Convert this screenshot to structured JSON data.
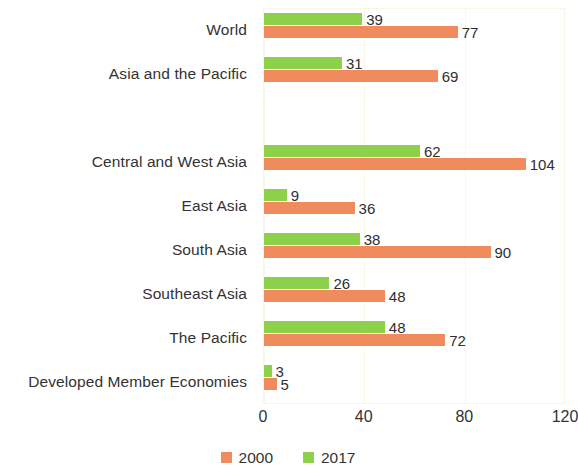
{
  "chart_data": {
    "type": "bar",
    "orientation": "horizontal",
    "title": "",
    "xlabel": "",
    "ylabel": "",
    "xlim": [
      0,
      120
    ],
    "xticks": [
      "0",
      "40",
      "80",
      "120"
    ],
    "grid": true,
    "legend_position": "bottom",
    "categories": [
      "World",
      "Asia and the Pacific",
      "",
      "Central and West Asia",
      "East Asia",
      "South Asia",
      "Southeast Asia",
      "The Pacific",
      "Developed Member Economies"
    ],
    "series": [
      {
        "name": "2000",
        "color": "#ef8b5d",
        "values": [
          77,
          69,
          null,
          104,
          36,
          90,
          48,
          72,
          5
        ]
      },
      {
        "name": "2017",
        "color": "#8dd14a",
        "values": [
          39,
          31,
          null,
          62,
          9,
          38,
          26,
          48,
          3
        ]
      }
    ]
  },
  "legend": {
    "items": [
      {
        "label": "2000",
        "color": "#ef8b5d"
      },
      {
        "label": "2017",
        "color": "#8dd14a"
      }
    ]
  }
}
